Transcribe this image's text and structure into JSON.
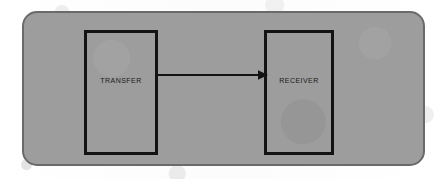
{
  "diagram": {
    "panel": {
      "fill_color": "#9d9d9d",
      "border_color": "#6a6a6a"
    },
    "nodes": [
      {
        "id": "transfer",
        "label": "TRANSFER",
        "border_color": "#131313",
        "text_color": "#1a1a1a"
      },
      {
        "id": "receiver",
        "label": "RECEIVER",
        "border_color": "#131313",
        "text_color": "#1a1a1a"
      }
    ],
    "connectors": [
      {
        "id": "transfer-to-receiver",
        "from": "transfer",
        "to": "receiver",
        "label": "",
        "style": "solid",
        "arrowhead": "filled-triangle",
        "direction": "right",
        "color": "#131313"
      }
    ],
    "background_color": "#fdfdfd"
  }
}
